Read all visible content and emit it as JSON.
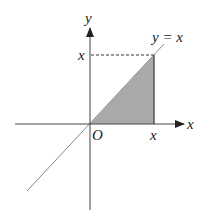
{
  "diagram": {
    "labels": {
      "y_axis": "y",
      "x_axis": "x",
      "origin": "O",
      "x_tick": "x",
      "y_tick": "x",
      "line": "y = x"
    },
    "colors": {
      "shade": "#a9a9a9",
      "axis": "#444444",
      "line": "#888888"
    }
  }
}
